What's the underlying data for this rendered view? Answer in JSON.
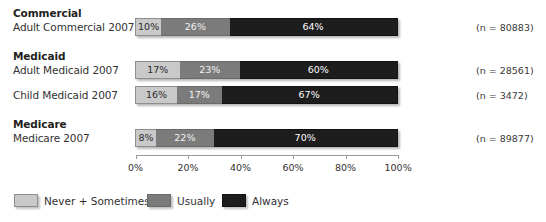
{
  "chart_data": {
    "type": "bar",
    "orientation": "horizontal",
    "stacked": true,
    "title": "",
    "xlabel": "",
    "ylabel": "",
    "xlim": [
      0,
      100
    ],
    "xticks": [
      "0%",
      "20%",
      "40%",
      "60%",
      "80%",
      "100%"
    ],
    "xtick_values": [
      0,
      20,
      40,
      60,
      80,
      100
    ],
    "grid": false,
    "legend_position": "bottom-left",
    "series": [
      {
        "name": "Never + Sometimes",
        "color": "#c9c9c9",
        "values": [
          10,
          17,
          16,
          8
        ]
      },
      {
        "name": "Usually",
        "color": "#7b7b7b",
        "values": [
          26,
          23,
          17,
          22
        ]
      },
      {
        "name": "Always",
        "color": "#1d1d1d",
        "values": [
          64,
          60,
          67,
          70
        ]
      }
    ],
    "categories": [
      "Adult Commercial 2007",
      "Adult Medicaid 2007",
      "Child Medicaid 2007",
      "Medicare 2007"
    ],
    "annotations": [
      "(n = 80883)",
      "(n = 28561)",
      "(n = 3472)",
      "(n = 89877)"
    ]
  },
  "groups": [
    {
      "heading": "Commercial",
      "rows": [
        {
          "label": "Adult Commercial 2007",
          "n_label": "(n = 80883)",
          "segments": [
            {
              "key": "never",
              "value": 10,
              "text": "10%"
            },
            {
              "key": "usually",
              "value": 26,
              "text": "26%"
            },
            {
              "key": "always",
              "value": 64,
              "text": "64%"
            }
          ]
        }
      ]
    },
    {
      "heading": "Medicaid",
      "rows": [
        {
          "label": "Adult Medicaid 2007",
          "n_label": "(n = 28561)",
          "segments": [
            {
              "key": "never",
              "value": 17,
              "text": "17%"
            },
            {
              "key": "usually",
              "value": 23,
              "text": "23%"
            },
            {
              "key": "always",
              "value": 60,
              "text": "60%"
            }
          ]
        },
        {
          "label": "Child Medicaid 2007",
          "n_label": "(n = 3472)",
          "segments": [
            {
              "key": "never",
              "value": 16,
              "text": "16%"
            },
            {
              "key": "usually",
              "value": 17,
              "text": "17%"
            },
            {
              "key": "always",
              "value": 67,
              "text": "67%"
            }
          ]
        }
      ]
    },
    {
      "heading": "Medicare",
      "rows": [
        {
          "label": "Medicare 2007",
          "n_label": "(n = 89877)",
          "segments": [
            {
              "key": "never",
              "value": 8,
              "text": "8%"
            },
            {
              "key": "usually",
              "value": 22,
              "text": "22%"
            },
            {
              "key": "always",
              "value": 70,
              "text": "70%"
            }
          ]
        }
      ]
    }
  ],
  "axis": {
    "ticks": [
      {
        "label": "0%",
        "value": 0
      },
      {
        "label": "20%",
        "value": 20
      },
      {
        "label": "40%",
        "value": 40
      },
      {
        "label": "60%",
        "value": 60
      },
      {
        "label": "80%",
        "value": 80
      },
      {
        "label": "100%",
        "value": 100
      }
    ]
  },
  "legend": {
    "items": [
      {
        "label": "Never + Sometimes",
        "swatch": "never"
      },
      {
        "label": "Usually",
        "swatch": "usual"
      },
      {
        "label": "Always",
        "swatch": "always"
      }
    ]
  },
  "colors": {
    "never": "#c9c9c9",
    "usually": "#7b7b7b",
    "always": "#1d1d1d",
    "text": "#333132",
    "axis": "#9a9a9a"
  }
}
